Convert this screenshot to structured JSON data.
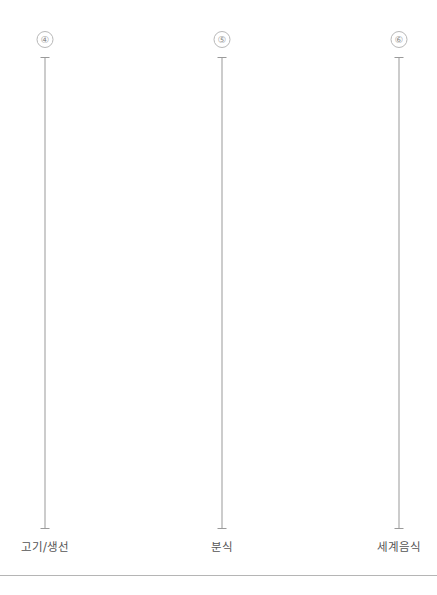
{
  "page": {
    "background_color": "#ffffff",
    "width": 437,
    "height": 595
  },
  "footer": {
    "rule_color": "#b5b5b5",
    "rule_y": 575
  },
  "columns": [
    {
      "marker": "④",
      "label": "고기/생선",
      "x": 45,
      "line_top": 57,
      "line_bottom": 529,
      "line_color": "#9a9a9a",
      "marker_color": "#8d8d8d",
      "label_color": "#555555"
    },
    {
      "marker": "⑤",
      "label": "분식",
      "x": 222,
      "line_top": 57,
      "line_bottom": 529,
      "line_color": "#9a9a9a",
      "marker_color": "#8d8d8d",
      "label_color": "#555555"
    },
    {
      "marker": "⑥",
      "label": "세계음식",
      "x": 399,
      "line_top": 57,
      "line_bottom": 529,
      "line_color": "#9a9a9a",
      "marker_color": "#8d8d8d",
      "label_color": "#555555"
    }
  ]
}
